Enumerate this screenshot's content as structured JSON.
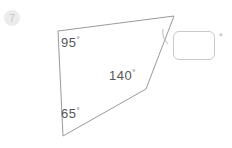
{
  "canvas": {
    "width": 232,
    "height": 148,
    "background": "#ffffff"
  },
  "question": {
    "number": "7",
    "badge_name": "question-number-badge"
  },
  "figure": {
    "type": "polygon",
    "stroke_color": "#9a9a9a",
    "fill_color": "#ffffff",
    "vertices": [
      {
        "name": "top-left",
        "x": 58,
        "y": 31
      },
      {
        "name": "top-right",
        "x": 174,
        "y": 16
      },
      {
        "name": "reflex",
        "x": 146,
        "y": 89
      },
      {
        "name": "bottom-left",
        "x": 63,
        "y": 136
      }
    ],
    "unknown_angle_marker": {
      "at_vertex": "top-right",
      "type": "arc",
      "color": "#bdbdbd"
    }
  },
  "labels": {
    "angle_a": {
      "value": "95",
      "degree": "°",
      "at_vertex": "top-left"
    },
    "angle_b": {
      "value": "140",
      "degree": "°",
      "at_vertex": "reflex"
    },
    "angle_c": {
      "value": "65",
      "degree": "°",
      "at_vertex": "bottom-left"
    }
  },
  "answer": {
    "value": "",
    "placeholder": "",
    "unit": "°"
  }
}
